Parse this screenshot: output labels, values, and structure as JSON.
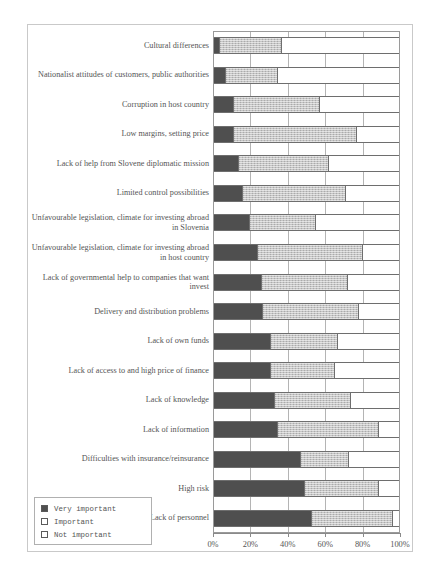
{
  "chart_data": {
    "type": "bar",
    "subtype": "stacked-horizontal-100percent",
    "title": "",
    "xlabel": "",
    "ylabel": "",
    "xlim": [
      0,
      100
    ],
    "xticks": [
      "0%",
      "20%",
      "40%",
      "60%",
      "80%",
      "100%"
    ],
    "xtick_values": [
      0,
      20,
      40,
      60,
      80,
      100
    ],
    "grid": true,
    "legend_position": "bottom-left",
    "categories": [
      "Cultural differences",
      "Nationalist attitudes of customers, public authorities",
      "Corruption in host country",
      "Low margins, setting price",
      "Lack of help from Slovene diplomatic mission",
      "Limited control possibilities",
      "Unfavourable legislation, climate for investing abroad in Slovenia",
      "Unfavourable legislation, climate for investing abroad in host country",
      "Lack of governmental help to companies that want invest",
      "Delivery and distribution problems",
      "Lack of own funds",
      "Lack of access to and high price of finance",
      "Lack of knowledge",
      "Lack of information",
      "Difficulties with insurance/reinsurance",
      "High risk",
      "Lack of personnel"
    ],
    "series": [
      {
        "name": "Very important",
        "color": "#4f4f4f",
        "values": [
          4,
          7,
          11,
          11,
          14,
          16,
          20,
          24,
          26,
          27,
          31,
          31,
          33,
          35,
          47,
          49,
          53
        ]
      },
      {
        "name": "Important",
        "color": "#c5c5c5",
        "values": [
          33,
          28,
          46,
          66,
          48,
          55,
          35,
          56,
          46,
          51,
          36,
          34,
          41,
          54,
          26,
          40,
          43
        ]
      },
      {
        "name": "Not important",
        "color": "#ffffff",
        "values": [
          63,
          65,
          43,
          23,
          38,
          29,
          45,
          20,
          28,
          22,
          33,
          35,
          26,
          11,
          27,
          11,
          4
        ]
      }
    ]
  },
  "legend": {
    "items": [
      {
        "label": "Very important",
        "swatch": "filled-dark-square"
      },
      {
        "label": "Important",
        "swatch": "hatched-square"
      },
      {
        "label": "Not important",
        "swatch": "empty-square"
      }
    ]
  }
}
